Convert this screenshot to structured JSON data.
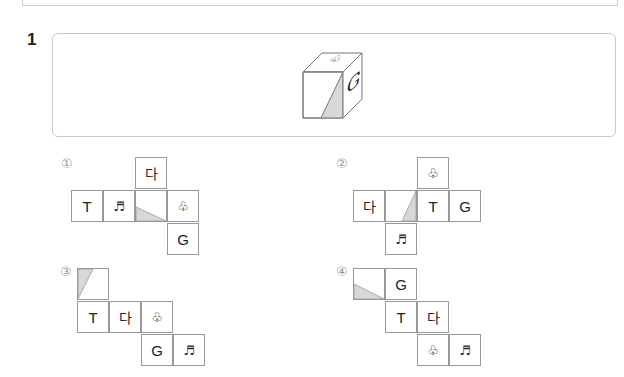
{
  "question": {
    "number": "1"
  },
  "cube": {
    "top_face": "♧",
    "right_face": "G",
    "front_face": "shaded-diagonal"
  },
  "options": [
    {
      "label": "①",
      "cells": [
        {
          "text": "다",
          "kind": "kor"
        },
        {
          "text": "T",
          "kind": "latin"
        },
        {
          "text": "♬",
          "kind": "sym"
        },
        {
          "text": "",
          "kind": "shaded-lower-left-triangle"
        },
        {
          "text": "♧",
          "kind": "sym"
        },
        {
          "text": "G",
          "kind": "latin"
        }
      ]
    },
    {
      "label": "②",
      "cells": [
        {
          "text": "♧",
          "kind": "sym"
        },
        {
          "text": "다",
          "kind": "kor"
        },
        {
          "text": "",
          "kind": "shaded-right-triangle"
        },
        {
          "text": "T",
          "kind": "latin"
        },
        {
          "text": "G",
          "kind": "latin"
        },
        {
          "text": "♬",
          "kind": "sym"
        }
      ]
    },
    {
      "label": "③",
      "cells": [
        {
          "text": "",
          "kind": "shaded-left-triangle"
        },
        {
          "text": "T",
          "kind": "latin"
        },
        {
          "text": "다",
          "kind": "kor"
        },
        {
          "text": "♧",
          "kind": "sym"
        },
        {
          "text": "G",
          "kind": "latin"
        },
        {
          "text": "♬",
          "kind": "sym"
        }
      ]
    },
    {
      "label": "④",
      "cells": [
        {
          "text": "",
          "kind": "shaded-lower-left-triangle"
        },
        {
          "text": "G",
          "kind": "latin"
        },
        {
          "text": "T",
          "kind": "latin"
        },
        {
          "text": "다",
          "kind": "kor"
        },
        {
          "text": "♧",
          "kind": "sym"
        },
        {
          "text": "♬",
          "kind": "sym"
        }
      ]
    }
  ]
}
